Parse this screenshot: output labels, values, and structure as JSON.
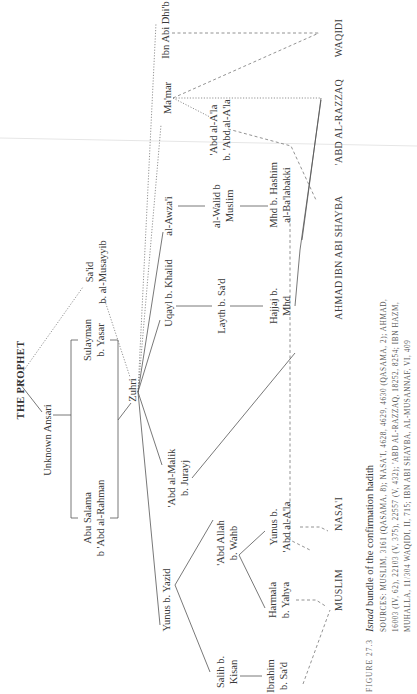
{
  "diagram": {
    "root": "THE PROPHET",
    "nodes": {
      "unknown_ansari": "Unknown Ansari",
      "abu_salama_1": "Abu Salama",
      "abu_salama_2": "b 'Abd al-Rahman",
      "sulayman_1": "Sulayman",
      "sulayman_2": "b. Yasar",
      "said_1": "Sa'id",
      "said_2": "b. al-Musayyib",
      "zuhri": "Zuhri",
      "yunus_yazid": "Yunus b. Yazid",
      "abd_al_malik_1": "'Abd al-Malik",
      "abd_al_malik_2": "b. Jurayj",
      "uqayl": "Uqayl b. Khalid",
      "awzai": "al-Awza'i",
      "mamar": "Ma'mar",
      "ibn_abi_dhib": "Ibn Abi Dhi'b",
      "salih_1": "Salih b.",
      "salih_2": "Kisan",
      "abd_allah_1": "'Abd Allah",
      "abd_allah_2": "b. Wahb",
      "layth": "Layth b. Sa'd",
      "walid_1": "al-Walid b",
      "walid_2": "Muslim",
      "abd_ala_1": "'Abd al-A'la",
      "abd_ala_2": "b. 'Abd al-A'la",
      "ibrahim_1": "Ibrahim",
      "ibrahim_2": "b. Sa'd",
      "harmala_1": "Harmala",
      "harmala_2": "b. Yahya",
      "yunus_ala_1": "Yunus b.",
      "yunus_ala_2": "'Abd al-A'la",
      "hajjaj_1": "Hajjaj b.",
      "hajjaj_2": "Mhd",
      "mhd_hashim_1": "Mhd b. Hashim",
      "mhd_hashim_2": "al-Ba'labakki"
    },
    "collectors": {
      "muslim": "MUSLIM",
      "nasai": "NASA'I",
      "ahmad": "AHMAD",
      "ibn_abi_shayba": "IBN ABI SHAYBA",
      "abd_al_razzaq": "'ABD AL-RAZZAQ",
      "waqidi": "WAQIDI"
    }
  },
  "caption": {
    "figure_label": "FIGURE 27.3",
    "title_italic": "Isnad",
    "title_rest": " bundle of the confirmation hadith",
    "line1": "SOURCES: MUSLIM, 3161 (QASAMA, 8); NASA'I, 4628, 4629, 4630 (QASAMA, 2); AHMAD,",
    "line2": "16003 (IV, 62), 22103 (V, 375), 22557 (V, 432); 'ABD AL-RAZZAQ, 18252, 8254; IBN HAZM,",
    "line3": "MUHALLA, 11/304 WAQIDI, II, 715; IBN ABI SHAYBA, AL-MUSANNAF, VI, 409"
  }
}
